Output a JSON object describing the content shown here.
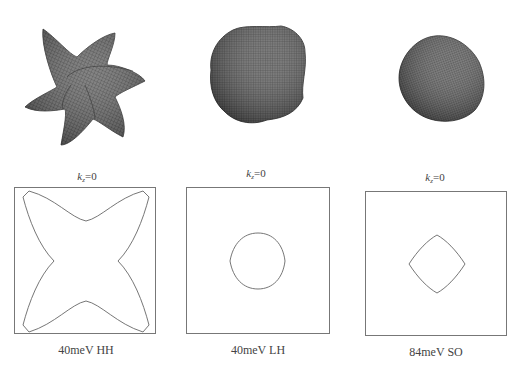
{
  "panels": [
    {
      "surface_name": "heavy-hole-isosurface",
      "surface_shape": "six-pointed-star",
      "section_label": {
        "k": "k",
        "sub": "z",
        "eq": "=0"
      },
      "contour_shape": "four-armed-star",
      "caption": "40meV HH"
    },
    {
      "surface_name": "light-hole-isosurface",
      "surface_shape": "rounded-cube",
      "section_label": {
        "k": "k",
        "sub": "z",
        "eq": "=0"
      },
      "contour_shape": "rounded-circle",
      "caption": "40meV LH"
    },
    {
      "surface_name": "split-off-isosurface",
      "surface_shape": "rounded-sphere",
      "section_label": {
        "k": "k",
        "sub": "z",
        "eq": "=0"
      },
      "contour_shape": "rounded-square-diamond",
      "caption": "84meV SO"
    }
  ],
  "colors": {
    "surface_fill": "#5a5a5a",
    "surface_grid": "#2e2e2e",
    "contour_stroke": "#555555",
    "box_border": "#777777"
  }
}
